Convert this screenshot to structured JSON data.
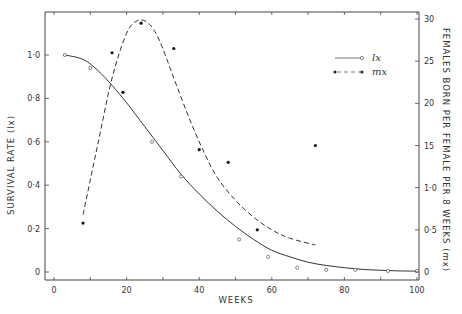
{
  "chart_data": {
    "type": "line",
    "title": "",
    "xlabel": "WEEKS",
    "ylabel": "SURVIVAL RATE (lx)",
    "y2label": "FEMALES BORN PER FEMALE PER 8 WEEKS (mx)",
    "xlim": [
      0,
      100
    ],
    "ylim": [
      0,
      1.0
    ],
    "y2lim": [
      0,
      30
    ],
    "x_ticks": [
      0,
      20,
      40,
      60,
      80,
      100
    ],
    "x_tick_labels": [
      "0",
      "20",
      "40",
      "60",
      "80",
      "100"
    ],
    "y_ticks": [
      0,
      0.2,
      0.4,
      0.6,
      0.8,
      1.0
    ],
    "y_tick_labels": [
      "0",
      "0·2",
      "0·4",
      "0·6",
      "0·8",
      "1·0"
    ],
    "y2_ticks": [
      0,
      5,
      10,
      15,
      20,
      25,
      30
    ],
    "y2_tick_labels": [
      "0",
      "0·5",
      "1·0",
      "15",
      "20",
      "25",
      "30"
    ],
    "grid": false,
    "legend_position": "upper right",
    "series": [
      {
        "name": "lx",
        "axis": "left",
        "style": "solid line, open circle markers",
        "points": [
          [
            3,
            1.0
          ],
          [
            10,
            0.94
          ],
          [
            27,
            0.6
          ],
          [
            35,
            0.44
          ],
          [
            51,
            0.15
          ],
          [
            59,
            0.07
          ],
          [
            67,
            0.02
          ],
          [
            75,
            0.01
          ],
          [
            83,
            0.01
          ],
          [
            92,
            0.005
          ],
          [
            100,
            0.005
          ]
        ],
        "curve": [
          [
            3,
            1.0
          ],
          [
            8,
            0.98
          ],
          [
            12,
            0.93
          ],
          [
            16,
            0.86
          ],
          [
            20,
            0.78
          ],
          [
            25,
            0.67
          ],
          [
            30,
            0.56
          ],
          [
            35,
            0.45
          ],
          [
            40,
            0.36
          ],
          [
            45,
            0.28
          ],
          [
            50,
            0.21
          ],
          [
            55,
            0.15
          ],
          [
            60,
            0.1
          ],
          [
            65,
            0.07
          ],
          [
            70,
            0.045
          ],
          [
            75,
            0.03
          ],
          [
            80,
            0.02
          ],
          [
            85,
            0.012
          ],
          [
            90,
            0.008
          ],
          [
            95,
            0.005
          ],
          [
            100,
            0.004
          ]
        ]
      },
      {
        "name": "mx",
        "axis": "right",
        "style": "dashed line, filled dot markers",
        "points": [
          [
            8,
            5.8
          ],
          [
            16,
            26.0
          ],
          [
            19,
            21.3
          ],
          [
            24,
            29.5
          ],
          [
            33,
            26.5
          ],
          [
            40,
            14.5
          ],
          [
            48,
            13.0
          ],
          [
            56,
            5.0
          ],
          [
            72,
            15.0
          ]
        ],
        "curve": [
          [
            8,
            6.8
          ],
          [
            12,
            15
          ],
          [
            16,
            23
          ],
          [
            20,
            28.3
          ],
          [
            23,
            29.8
          ],
          [
            26,
            29.5
          ],
          [
            29,
            27.5
          ],
          [
            33,
            23
          ],
          [
            37,
            18.5
          ],
          [
            41,
            14.5
          ],
          [
            45,
            11.2
          ],
          [
            50,
            8.5
          ],
          [
            55,
            6.5
          ],
          [
            60,
            5.0
          ],
          [
            65,
            4.0
          ],
          [
            72,
            3.2
          ]
        ]
      }
    ]
  },
  "legend": {
    "lx_label": "lx",
    "mx_label": "mx"
  },
  "axes": {
    "x_title": "WEEKS",
    "y_left_title": "SURVIVAL   RATE   (lx)",
    "y_right_title": "FEMALES  BORN  PER  FEMALE  PER  8  WEEKS  (mx)"
  }
}
